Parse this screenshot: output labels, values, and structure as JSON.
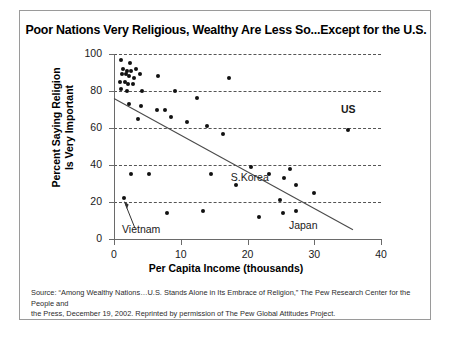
{
  "chart_data": {
    "type": "scatter",
    "title": "Poor Nations Very Religious, Wealthy Are Less So...Except for the U.S.",
    "xlabel": "Per Capita Income (thousands)",
    "ylabel": "Percent Saying Religion Is Very Important",
    "xlim": [
      0,
      40
    ],
    "ylim": [
      0,
      100
    ],
    "xticks": [
      0,
      10,
      20,
      30,
      40
    ],
    "yticks": [
      0,
      20,
      40,
      60,
      80,
      100
    ],
    "grid": "horizontal-dashed",
    "legend": "none",
    "points": [
      {
        "x": 1.0,
        "y": 97
      },
      {
        "x": 2.4,
        "y": 95
      },
      {
        "x": 1.3,
        "y": 92
      },
      {
        "x": 1.9,
        "y": 91
      },
      {
        "x": 2.6,
        "y": 91
      },
      {
        "x": 3.3,
        "y": 92
      },
      {
        "x": 1.2,
        "y": 89
      },
      {
        "x": 1.8,
        "y": 89
      },
      {
        "x": 2.3,
        "y": 88
      },
      {
        "x": 3.0,
        "y": 87
      },
      {
        "x": 3.9,
        "y": 89
      },
      {
        "x": 6.6,
        "y": 88
      },
      {
        "x": 17.3,
        "y": 87
      },
      {
        "x": 0.9,
        "y": 85
      },
      {
        "x": 1.6,
        "y": 85
      },
      {
        "x": 2.1,
        "y": 84
      },
      {
        "x": 2.9,
        "y": 84
      },
      {
        "x": 1.1,
        "y": 81
      },
      {
        "x": 2.0,
        "y": 80
      },
      {
        "x": 4.2,
        "y": 80
      },
      {
        "x": 9.1,
        "y": 80
      },
      {
        "x": 12.4,
        "y": 76
      },
      {
        "x": 2.3,
        "y": 73
      },
      {
        "x": 4.0,
        "y": 72
      },
      {
        "x": 6.4,
        "y": 70
      },
      {
        "x": 7.7,
        "y": 70
      },
      {
        "x": 3.6,
        "y": 65
      },
      {
        "x": 8.6,
        "y": 66
      },
      {
        "x": 11.0,
        "y": 63
      },
      {
        "x": 13.9,
        "y": 61
      },
      {
        "x": 16.3,
        "y": 57
      },
      {
        "x": 35.0,
        "y": 59
      },
      {
        "x": 20.5,
        "y": 39
      },
      {
        "x": 26.3,
        "y": 38
      },
      {
        "x": 23.2,
        "y": 35
      },
      {
        "x": 2.6,
        "y": 35
      },
      {
        "x": 5.2,
        "y": 35
      },
      {
        "x": 14.5,
        "y": 35
      },
      {
        "x": 25.4,
        "y": 33
      },
      {
        "x": 18.3,
        "y": 29
      },
      {
        "x": 27.2,
        "y": 29
      },
      {
        "x": 29.9,
        "y": 25
      },
      {
        "x": 1.5,
        "y": 22
      },
      {
        "x": 24.8,
        "y": 21
      },
      {
        "x": 8.0,
        "y": 14
      },
      {
        "x": 13.3,
        "y": 15
      },
      {
        "x": 25.3,
        "y": 14
      },
      {
        "x": 27.3,
        "y": 15
      },
      {
        "x": 21.7,
        "y": 12
      }
    ],
    "trendline": {
      "x0": 0,
      "y0": 76,
      "x1": 35.8,
      "y1": 5
    },
    "annotations": [
      {
        "text": "US",
        "x": 34.0,
        "y": 70,
        "style": "bold"
      },
      {
        "text": "S.Korea",
        "x": 17.5,
        "y": 33,
        "style": "normal"
      },
      {
        "text": "Japan",
        "x": 26.2,
        "y": 7,
        "style": "normal"
      },
      {
        "text": "Vietnam",
        "x": 1.2,
        "y": 5,
        "style": "normal"
      }
    ],
    "callout": {
      "label": "Vietnam",
      "target_point": {
        "x": 1.5,
        "y": 22
      }
    }
  },
  "source": {
    "line1": "Source: “Among Wealthy Nations…U.S. Stands Alone in Its Embrace of Religion,” The Pew Research Center for the People and",
    "line2": "the Press, December 19, 2002. Reprinted by permission of The Pew Global Attitudes Project."
  }
}
